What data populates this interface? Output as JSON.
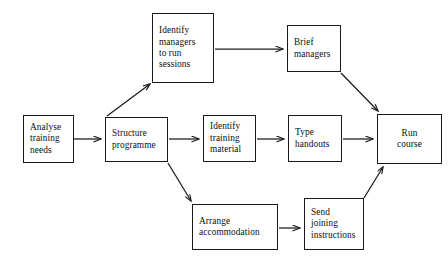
{
  "diagram": {
    "type": "flowchart",
    "background_color": "#ffffff",
    "line_color": "#1a1a1a",
    "text_color": "#0d0d0d",
    "nodes": [
      {
        "id": "analyse-training-needs",
        "label": "Analyse\ntraining\nneeds",
        "x": 23,
        "y": 115,
        "w": 51,
        "h": 48,
        "align": "left"
      },
      {
        "id": "structure-programme",
        "label": "Structure\nprogramme",
        "x": 105,
        "y": 117,
        "w": 63,
        "h": 45,
        "align": "left"
      },
      {
        "id": "identify-managers-to-run-sessions",
        "label": "Identify\nmanagers\nto run\nsessions",
        "x": 152,
        "y": 13,
        "w": 62,
        "h": 70,
        "align": "left"
      },
      {
        "id": "brief-managers",
        "label": "Brief\nmanagers",
        "x": 287,
        "y": 25,
        "w": 54,
        "h": 47,
        "align": "left"
      },
      {
        "id": "identify-training-material",
        "label": "Identify\ntraining\nmaterial",
        "x": 203,
        "y": 115,
        "w": 53,
        "h": 47,
        "align": "left"
      },
      {
        "id": "type-handouts",
        "label": "Type\nhandouts",
        "x": 288,
        "y": 115,
        "w": 54,
        "h": 47,
        "align": "left"
      },
      {
        "id": "run-course",
        "label": "Run\ncourse",
        "x": 377,
        "y": 114,
        "w": 65,
        "h": 50,
        "align": "center"
      },
      {
        "id": "arrange-accommodation",
        "label": "Arrange\naccommodation",
        "x": 192,
        "y": 204,
        "w": 86,
        "h": 46,
        "align": "left"
      },
      {
        "id": "send-joining-instructions",
        "label": "Send\njoining\ninstructions",
        "x": 304,
        "y": 198,
        "w": 60,
        "h": 52,
        "align": "left"
      }
    ],
    "edges": [
      {
        "id": "analyse-to-structure",
        "from": "analyse-training-needs",
        "to": "structure-programme",
        "kind": "horizontal"
      },
      {
        "id": "structure-to-identify-managers",
        "from": "structure-programme",
        "to": "identify-managers-to-run-sessions",
        "kind": "diagonal-up"
      },
      {
        "id": "identify-managers-to-brief",
        "from": "identify-managers-to-run-sessions",
        "to": "brief-managers",
        "kind": "horizontal"
      },
      {
        "id": "brief-to-run-course",
        "from": "brief-managers",
        "to": "run-course",
        "kind": "diagonal-down"
      },
      {
        "id": "structure-to-identify-material",
        "from": "structure-programme",
        "to": "identify-training-material",
        "kind": "horizontal"
      },
      {
        "id": "identify-material-to-type-handouts",
        "from": "identify-training-material",
        "to": "type-handouts",
        "kind": "horizontal"
      },
      {
        "id": "type-handouts-to-run-course",
        "from": "type-handouts",
        "to": "run-course",
        "kind": "horizontal"
      },
      {
        "id": "structure-to-arrange-accommodation",
        "from": "structure-programme",
        "to": "arrange-accommodation",
        "kind": "diagonal-down"
      },
      {
        "id": "arrange-to-send-joining",
        "from": "arrange-accommodation",
        "to": "send-joining-instructions",
        "kind": "horizontal"
      },
      {
        "id": "send-joining-to-run-course",
        "from": "send-joining-instructions",
        "to": "run-course",
        "kind": "diagonal-up"
      }
    ]
  }
}
